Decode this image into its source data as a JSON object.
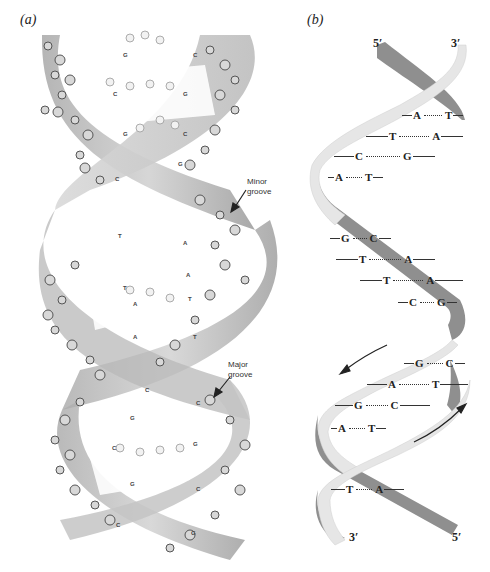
{
  "panels": {
    "a": {
      "label": "(a)",
      "annotations": {
        "minor_groove": "Minor\ngroove",
        "major_groove": "Major\ngroove"
      },
      "model_base_labels": [
        {
          "text": "G",
          "x": 123,
          "y": 52
        },
        {
          "text": "C",
          "x": 193,
          "y": 52
        },
        {
          "text": "C",
          "x": 113,
          "y": 91
        },
        {
          "text": "G",
          "x": 183,
          "y": 91
        },
        {
          "text": "G",
          "x": 123,
          "y": 131
        },
        {
          "text": "C",
          "x": 183,
          "y": 131
        },
        {
          "text": "G",
          "x": 178,
          "y": 161
        },
        {
          "text": "C",
          "x": 115,
          "y": 176
        },
        {
          "text": "T",
          "x": 118,
          "y": 233
        },
        {
          "text": "A",
          "x": 183,
          "y": 240
        },
        {
          "text": "A",
          "x": 186,
          "y": 272
        },
        {
          "text": "T",
          "x": 123,
          "y": 285
        },
        {
          "text": "A",
          "x": 133,
          "y": 301
        },
        {
          "text": "T",
          "x": 188,
          "y": 296
        },
        {
          "text": "A",
          "x": 133,
          "y": 334
        },
        {
          "text": "T",
          "x": 193,
          "y": 334
        },
        {
          "text": "C",
          "x": 145,
          "y": 387
        },
        {
          "text": "C",
          "x": 196,
          "y": 400
        },
        {
          "text": "G",
          "x": 130,
          "y": 415
        },
        {
          "text": "C",
          "x": 112,
          "y": 445
        },
        {
          "text": "G",
          "x": 193,
          "y": 441
        },
        {
          "text": "G",
          "x": 130,
          "y": 481
        },
        {
          "text": "C",
          "x": 196,
          "y": 486
        },
        {
          "text": "C",
          "x": 116,
          "y": 522
        },
        {
          "text": "G",
          "x": 191,
          "y": 530
        }
      ]
    },
    "b": {
      "label": "(b)",
      "ends": {
        "top_left": "5′",
        "top_right": "3′",
        "bottom_left": "3′",
        "bottom_right": "5′"
      },
      "base_pairs": [
        {
          "left": "A",
          "right": "T",
          "x": 402,
          "y": 116,
          "l1": 10,
          "dots": 18,
          "l2": 10
        },
        {
          "left": "T",
          "right": "A",
          "x": 366,
          "y": 137,
          "l1": 22,
          "dots": 30,
          "l2": 22
        },
        {
          "left": "C",
          "right": "G",
          "x": 334,
          "y": 157,
          "l1": 20,
          "dots": 34,
          "l2": 22
        },
        {
          "left": "A",
          "right": "T",
          "x": 328,
          "y": 178,
          "l1": 6,
          "dots": 16,
          "l2": 10
        },
        {
          "left": "G",
          "right": "C",
          "x": 330,
          "y": 239,
          "l1": 10,
          "dots": 14,
          "l2": 12
        },
        {
          "left": "T",
          "right": "A",
          "x": 336,
          "y": 260,
          "l1": 22,
          "dots": 32,
          "l2": 22
        },
        {
          "left": "T",
          "right": "A",
          "x": 360,
          "y": 281,
          "l1": 22,
          "dots": 30,
          "l2": 28
        },
        {
          "left": "C",
          "right": "G",
          "x": 398,
          "y": 303,
          "l1": 10,
          "dots": 14,
          "l2": 10
        },
        {
          "left": "G",
          "right": "C",
          "x": 404,
          "y": 364,
          "l1": 10,
          "dots": 16,
          "l2": 10
        },
        {
          "left": "A",
          "right": "T",
          "x": 367,
          "y": 385,
          "l1": 20,
          "dots": 30,
          "l2": 28
        },
        {
          "left": "G",
          "right": "C",
          "x": 335,
          "y": 406,
          "l1": 18,
          "dots": 22,
          "l2": 30
        },
        {
          "left": "A",
          "right": "T",
          "x": 331,
          "y": 429,
          "l1": 6,
          "dots": 16,
          "l2": 10
        },
        {
          "left": "T",
          "right": "A",
          "x": 331,
          "y": 490,
          "l1": 14,
          "dots": 16,
          "l2": 20
        }
      ],
      "arrows": [
        {
          "direction": "down-left",
          "from": [
            387,
            345
          ],
          "to": [
            342,
            372
          ]
        },
        {
          "direction": "up-right",
          "from": [
            414,
            442
          ],
          "to": [
            464,
            406
          ]
        }
      ]
    }
  },
  "colors": {
    "strand_light": "#e6e6e6",
    "strand_dark": "#8f8f8f",
    "ribbon_shade": "#b5b5b5",
    "ink": "#222222"
  }
}
